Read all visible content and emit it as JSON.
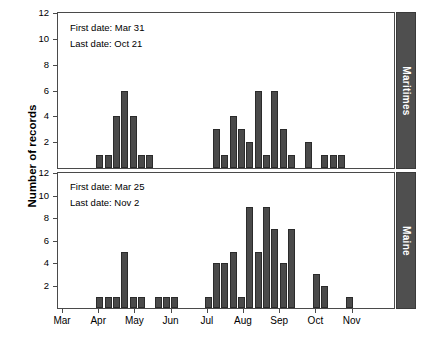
{
  "figure": {
    "ylabel": "Number of records",
    "panel_labels": [
      "Maritimes",
      "Maine"
    ],
    "bar_color": "#4a4a4a",
    "strip_color": "#4f4f4f",
    "axis_color": "#4a4a4a"
  },
  "annotations": {
    "maritimes": {
      "first_date": "First date: Mar 31",
      "last_date": "Last date: Oct 21"
    },
    "maine": {
      "first_date": "First date: Mar 25",
      "last_date": "Last date: Nov 2"
    }
  },
  "axes": {
    "y_ticks": [
      0,
      2,
      4,
      6,
      8,
      10,
      12
    ],
    "y_tick_labels": [
      "",
      "2",
      "4",
      "6",
      "8",
      "10",
      "12"
    ],
    "x_ticks": [
      "Mar",
      "Apr",
      "May",
      "Jun",
      "Jul",
      "Aug",
      "Sep",
      "Oct",
      "Nov"
    ]
  },
  "chart_data": [
    {
      "type": "bar",
      "title": "Maritimes",
      "xlabel": "",
      "ylabel": "Number of records",
      "ylim": [
        0,
        12
      ],
      "grid": false,
      "legend": null,
      "annotations": [
        "First date: Mar 31",
        "Last date: Oct 21"
      ],
      "categories": [
        "Mar",
        "Apr",
        "May",
        "Jun",
        "Jul",
        "Aug",
        "Sep",
        "Oct",
        "Nov"
      ],
      "x_positions_weeks": [
        4,
        5,
        6,
        7,
        8,
        9,
        18,
        19,
        20,
        21,
        22,
        23,
        24,
        25,
        26,
        27,
        29,
        31,
        32,
        33
      ],
      "values": [
        1,
        1,
        4,
        6,
        4,
        1,
        1,
        3,
        1,
        4,
        3,
        2,
        6,
        1,
        6,
        3,
        1,
        2,
        1,
        1,
        1
      ],
      "bars": [
        {
          "week": 4,
          "value": 1
        },
        {
          "week": 5,
          "value": 1
        },
        {
          "week": 6,
          "value": 4
        },
        {
          "week": 7,
          "value": 6
        },
        {
          "week": 8,
          "value": 4
        },
        {
          "week": 9,
          "value": 1
        },
        {
          "week": 10,
          "value": 1
        },
        {
          "week": 18,
          "value": 3
        },
        {
          "week": 19,
          "value": 1
        },
        {
          "week": 20,
          "value": 4
        },
        {
          "week": 21,
          "value": 3
        },
        {
          "week": 22,
          "value": 2
        },
        {
          "week": 23,
          "value": 6
        },
        {
          "week": 24,
          "value": 1
        },
        {
          "week": 25,
          "value": 6
        },
        {
          "week": 26,
          "value": 3
        },
        {
          "week": 27,
          "value": 1
        },
        {
          "week": 29,
          "value": 2
        },
        {
          "week": 31,
          "value": 1
        },
        {
          "week": 32,
          "value": 1
        },
        {
          "week": 33,
          "value": 1
        }
      ]
    },
    {
      "type": "bar",
      "title": "Maine",
      "xlabel": "",
      "ylabel": "Number of records",
      "ylim": [
        0,
        12
      ],
      "grid": false,
      "legend": null,
      "annotations": [
        "First date: Mar 25",
        "Last date: Nov 2"
      ],
      "categories": [
        "Mar",
        "Apr",
        "May",
        "Jun",
        "Jul",
        "Aug",
        "Sep",
        "Oct",
        "Nov"
      ],
      "values": [
        1,
        1,
        1,
        5,
        1,
        1,
        1,
        1,
        1,
        1,
        4,
        4,
        5,
        1,
        9,
        5,
        9,
        7,
        4,
        7,
        3,
        2,
        1
      ],
      "bars": [
        {
          "week": 4,
          "value": 1
        },
        {
          "week": 5,
          "value": 1
        },
        {
          "week": 6,
          "value": 1
        },
        {
          "week": 7,
          "value": 5
        },
        {
          "week": 8,
          "value": 1
        },
        {
          "week": 9,
          "value": 1
        },
        {
          "week": 11,
          "value": 1
        },
        {
          "week": 12,
          "value": 1
        },
        {
          "week": 13,
          "value": 1
        },
        {
          "week": 17,
          "value": 1
        },
        {
          "week": 18,
          "value": 4
        },
        {
          "week": 19,
          "value": 4
        },
        {
          "week": 20,
          "value": 5
        },
        {
          "week": 21,
          "value": 1
        },
        {
          "week": 22,
          "value": 9
        },
        {
          "week": 23,
          "value": 5
        },
        {
          "week": 24,
          "value": 9
        },
        {
          "week": 25,
          "value": 7
        },
        {
          "week": 26,
          "value": 4
        },
        {
          "week": 27,
          "value": 7
        },
        {
          "week": 30,
          "value": 3
        },
        {
          "week": 31,
          "value": 2
        },
        {
          "week": 34,
          "value": 1
        }
      ]
    }
  ]
}
